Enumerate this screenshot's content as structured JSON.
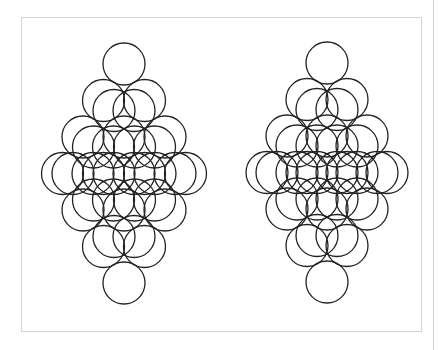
{
  "diagram": {
    "stroke_color": "#222222",
    "frame_color": "#d4d4d4",
    "circle_radius": 21,
    "figures": [
      {
        "name": "left-circle-diamond",
        "top_center": [
          124,
          64
        ],
        "step_x": 20.5,
        "step_y": 36.5,
        "lattice_size": 4,
        "inner_pair_dx": 10,
        "inner_pair_dy": 10
      },
      {
        "name": "right-circle-diamond",
        "top_center": [
          327,
          63
        ],
        "step_x": 20,
        "step_y": 36.5,
        "lattice_size": 4,
        "inner_pair_dx": 10,
        "inner_pair_dy": 10
      }
    ]
  }
}
